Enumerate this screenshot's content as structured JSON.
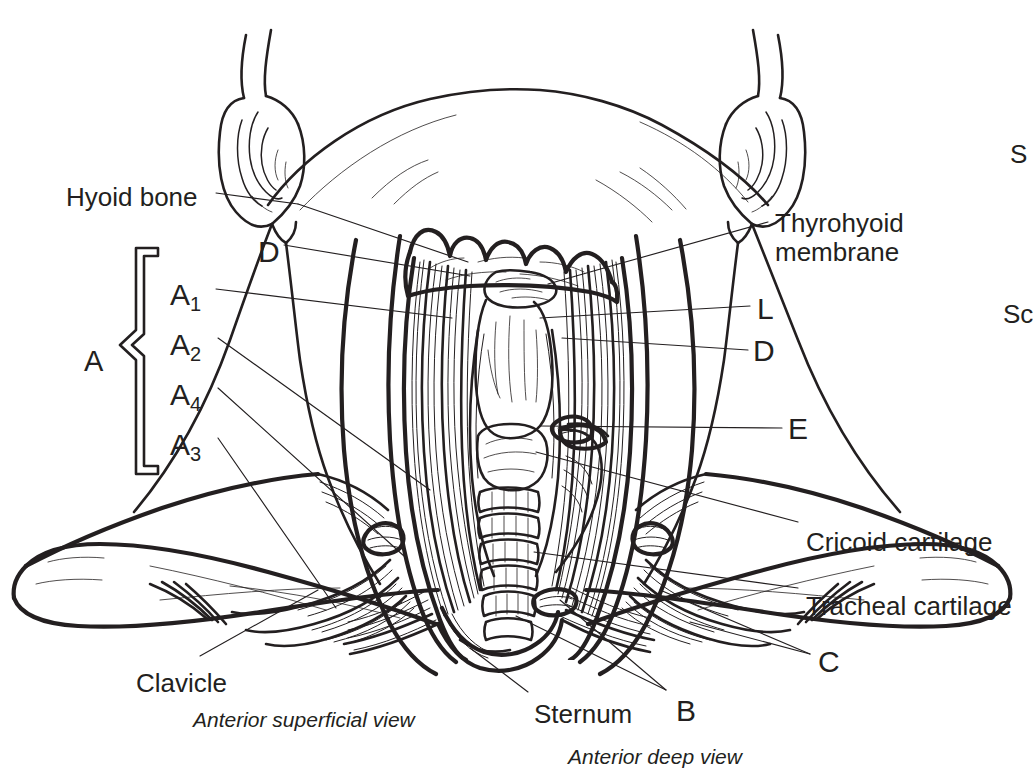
{
  "figure": {
    "background_color": "#ffffff",
    "ink_color": "#231f20",
    "view_captions": [
      {
        "id": "caption-superficial",
        "text": "Anterior superficial view",
        "x": 193,
        "y": 720
      },
      {
        "id": "caption-deep",
        "text": "Anterior deep view",
        "x": 568,
        "y": 757
      }
    ]
  },
  "labels": {
    "hyoid_bone": "Hyoid bone",
    "thyrohyoid_membrane_line1": "Thyrohyoid",
    "thyrohyoid_membrane_line2": "membrane",
    "cricoid_cartilage": "Cricoid cartilage",
    "tracheal_cartilage": "Tracheal cartilage",
    "clavicle": "Clavicle",
    "sternum": "Sternum"
  },
  "key_codes": {
    "bracket_group": "A",
    "a1": "A",
    "a1_sub": "1",
    "a2": "A",
    "a2_sub": "2",
    "a4": "A",
    "a4_sub": "4",
    "a3": "A",
    "a3_sub": "3",
    "d_left": "D",
    "l_right": "L",
    "d_right": "D",
    "e_right": "E",
    "b_bottom": "B",
    "c_bottom": "C"
  },
  "clipped_labels": [
    {
      "id": "clipped-s",
      "text": "S",
      "x": 1010,
      "y": 152
    },
    {
      "id": "clipped-sc",
      "text": "Sc",
      "x": 1003,
      "y": 313
    }
  ],
  "label_positions": {
    "hyoid_bone": {
      "x": 66,
      "y": 183
    },
    "thyrohyoid": {
      "x": 775,
      "y": 209
    },
    "cricoid": {
      "x": 806,
      "y": 528
    },
    "tracheal": {
      "x": 806,
      "y": 592
    },
    "clavicle": {
      "x": 136,
      "y": 669
    },
    "sternum": {
      "x": 534,
      "y": 700
    },
    "bracket_A": {
      "x": 84,
      "y": 345
    },
    "a1": {
      "x": 170,
      "y": 278
    },
    "a2": {
      "x": 170,
      "y": 328
    },
    "a4": {
      "x": 170,
      "y": 378
    },
    "a3": {
      "x": 170,
      "y": 428
    },
    "d_left": {
      "x": 258,
      "y": 235
    },
    "l_right": {
      "x": 757,
      "y": 292
    },
    "d_right": {
      "x": 753,
      "y": 334
    },
    "e_right": {
      "x": 788,
      "y": 412
    },
    "b_bottom": {
      "x": 676,
      "y": 694
    },
    "c_bottom": {
      "x": 818,
      "y": 645
    }
  }
}
